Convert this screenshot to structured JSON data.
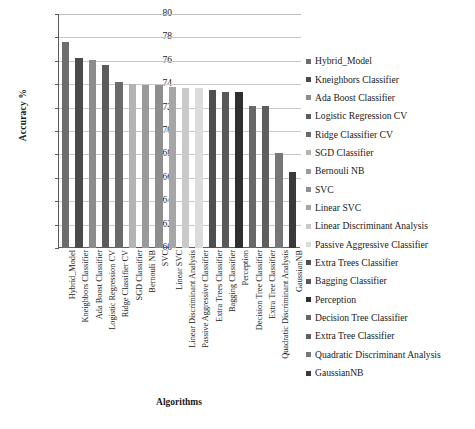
{
  "chart_data": {
    "type": "bar",
    "title": "",
    "xlabel": "Algorithms",
    "ylabel": "Accuracy %",
    "ylim": [
      60,
      80
    ],
    "ytick_step": 2,
    "yticks": [
      "80",
      "78",
      "76",
      "74",
      "72",
      "70",
      "68",
      "66",
      "64",
      "62",
      "60"
    ],
    "grid": true,
    "legend_position": "right",
    "categories": [
      "Hybrid_Model",
      "Kneighbors Classifier",
      "Ada Boost Classifier",
      "Logistic Regression CV",
      "Ridge Classifier CV",
      "SGD Classifier",
      "Bernouli NB",
      "SVC",
      "Linear SVC",
      "Linear Discriminant Analysis",
      "Passive Aggressive Classifier",
      "Extra Trees Classifier",
      "Bagging Classifier",
      "Perception",
      "Decision Tree Classifier",
      "Extra Tree Classifier",
      "Quadratic Discriminant Analysis",
      "GaussianNB"
    ],
    "values": [
      77.6,
      76.2,
      76.1,
      75.6,
      74.15,
      74.0,
      73.9,
      73.9,
      73.8,
      73.7,
      73.65,
      73.5,
      73.3,
      73.3,
      72.1,
      72.1,
      68.1,
      66.5
    ],
    "colors": [
      "#6d6d6d",
      "#4b4b4b",
      "#8c8c8c",
      "#5c5c5c",
      "#6a6a6a",
      "#b4b4b4",
      "#9a9a9a",
      "#8e8e8e",
      "#a6a6a6",
      "#c9c9c9",
      "#dcdcdc",
      "#4f4f4f",
      "#595959",
      "#2f2f2f",
      "#686868",
      "#5e5e5e",
      "#777777",
      "#3a3a3a"
    ]
  },
  "legend": {
    "items": [
      {
        "label": "Hybrid_Model",
        "color": "#6d6d6d"
      },
      {
        "label": "Kneighbors Classifier",
        "color": "#4b4b4b"
      },
      {
        "label": "Ada Boost Classifier",
        "color": "#8c8c8c"
      },
      {
        "label": "Logistic Regression CV",
        "color": "#5c5c5c"
      },
      {
        "label": "Ridge Classifier CV",
        "color": "#6a6a6a"
      },
      {
        "label": "SGD Classifier",
        "color": "#b4b4b4"
      },
      {
        "label": "Bernouli NB",
        "color": "#9a9a9a"
      },
      {
        "label": "SVC",
        "color": "#8e8e8e"
      },
      {
        "label": "Linear SVC",
        "color": "#a6a6a6"
      },
      {
        "label": "Linear Discriminant Analysis",
        "color": "#c9c9c9"
      },
      {
        "label": "Passive Aggressive Classifier",
        "color": "#dcdcdc"
      },
      {
        "label": "Extra Trees Classifier",
        "color": "#4f4f4f"
      },
      {
        "label": "Bagging Classifier",
        "color": "#595959"
      },
      {
        "label": "Perception",
        "color": "#2f2f2f"
      },
      {
        "label": "Decision Tree Classifier",
        "color": "#686868"
      },
      {
        "label": "Extra Tree Classifier",
        "color": "#5e5e5e"
      },
      {
        "label": "Quadratic Discriminant Analysis",
        "color": "#777777"
      },
      {
        "label": "GaussianNB",
        "color": "#3a3a3a"
      }
    ]
  }
}
